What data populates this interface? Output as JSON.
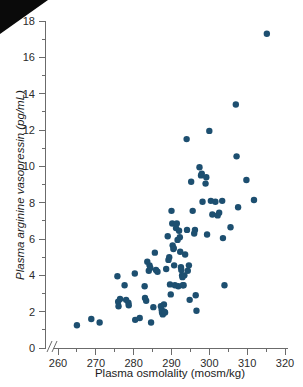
{
  "figure": {
    "background_color": "#ffffff",
    "point_color": "#1d4f70",
    "axis_color": "#6b6b6b",
    "corner_artifact": "black-triangle-top-left"
  },
  "chart_data": {
    "type": "scatter",
    "title": "",
    "xlabel": "Plasma osmolality (mosm/kg)",
    "ylabel": "Plasma arginine vasopressin (pg/mL)",
    "xlim": [
      258,
      320
    ],
    "ylim": [
      0,
      18
    ],
    "xticks": [
      260,
      270,
      280,
      290,
      300,
      310,
      320
    ],
    "yticks": [
      0,
      2,
      4,
      6,
      8,
      10,
      12,
      14,
      16,
      18
    ],
    "y_minor_ticks": [
      1,
      3,
      5,
      7,
      9,
      11,
      13,
      15,
      17
    ],
    "x_minor_ticks": [
      265,
      275,
      285,
      295,
      305,
      315
    ],
    "axis_break": true,
    "grid": false,
    "legend": null,
    "marker": "filled-circle",
    "marker_size_px": 4.2,
    "series": [
      {
        "name": "Subjects",
        "points": [
          [
            265.0,
            1.25
          ],
          [
            268.8,
            1.6
          ],
          [
            271.0,
            1.4
          ],
          [
            275.7,
            3.95
          ],
          [
            275.9,
            2.55
          ],
          [
            276.0,
            2.3
          ],
          [
            276.4,
            2.7
          ],
          [
            277.6,
            3.45
          ],
          [
            278.0,
            2.65
          ],
          [
            278.6,
            2.5
          ],
          [
            278.7,
            2.35
          ],
          [
            280.3,
            4.1
          ],
          [
            280.4,
            1.55
          ],
          [
            281.6,
            1.65
          ],
          [
            282.9,
            3.4
          ],
          [
            283.0,
            2.75
          ],
          [
            283.3,
            2.6
          ],
          [
            283.6,
            4.75
          ],
          [
            284.0,
            4.25
          ],
          [
            284.2,
            4.55
          ],
          [
            284.4,
            4.4
          ],
          [
            284.6,
            1.4
          ],
          [
            285.2,
            2.25
          ],
          [
            285.6,
            5.25
          ],
          [
            285.9,
            4.3
          ],
          [
            286.3,
            4.2
          ],
          [
            287.2,
            2.3
          ],
          [
            287.4,
            2.1
          ],
          [
            287.5,
            1.95
          ],
          [
            287.6,
            2.0
          ],
          [
            287.7,
            1.85
          ],
          [
            288.0,
            2.4
          ],
          [
            288.1,
            2.0
          ],
          [
            288.3,
            1.95
          ],
          [
            288.6,
            4.35
          ],
          [
            289.0,
            6.15
          ],
          [
            289.2,
            4.85
          ],
          [
            289.4,
            5.0
          ],
          [
            289.6,
            3.5
          ],
          [
            289.8,
            2.95
          ],
          [
            290.0,
            7.55
          ],
          [
            290.2,
            6.85
          ],
          [
            290.3,
            5.65
          ],
          [
            290.5,
            5.45
          ],
          [
            290.6,
            5.5
          ],
          [
            290.7,
            4.55
          ],
          [
            290.9,
            3.45
          ],
          [
            291.2,
            6.6
          ],
          [
            291.4,
            6.85
          ],
          [
            291.6,
            5.95
          ],
          [
            291.8,
            3.4
          ],
          [
            292.0,
            6.45
          ],
          [
            292.2,
            6.1
          ],
          [
            292.3,
            5.3
          ],
          [
            292.5,
            4.45
          ],
          [
            292.6,
            4.3
          ],
          [
            292.8,
            4.0
          ],
          [
            292.9,
            3.9
          ],
          [
            293.0,
            3.45
          ],
          [
            293.2,
            3.45
          ],
          [
            293.4,
            4.0
          ],
          [
            293.6,
            5.15
          ],
          [
            294.0,
            11.5
          ],
          [
            294.1,
            6.5
          ],
          [
            294.3,
            4.25
          ],
          [
            294.6,
            4.55
          ],
          [
            294.8,
            2.65
          ],
          [
            295.2,
            9.15
          ],
          [
            295.6,
            7.55
          ],
          [
            296.0,
            6.3
          ],
          [
            296.2,
            6.5
          ],
          [
            296.4,
            2.9
          ],
          [
            296.6,
            2.05
          ],
          [
            297.4,
            9.95
          ],
          [
            297.8,
            9.5
          ],
          [
            298.0,
            9.6
          ],
          [
            298.2,
            8.05
          ],
          [
            299.0,
            9.05
          ],
          [
            299.2,
            9.4
          ],
          [
            299.4,
            6.25
          ],
          [
            300.0,
            11.95
          ],
          [
            300.4,
            8.1
          ],
          [
            300.8,
            7.35
          ],
          [
            301.6,
            8.05
          ],
          [
            302.2,
            7.3
          ],
          [
            302.6,
            7.45
          ],
          [
            303.4,
            8.1
          ],
          [
            303.6,
            6.05
          ],
          [
            304.0,
            3.45
          ],
          [
            305.6,
            6.65
          ],
          [
            307.0,
            13.4
          ],
          [
            307.2,
            10.55
          ],
          [
            307.6,
            7.75
          ],
          [
            309.8,
            9.25
          ],
          [
            311.8,
            8.15
          ],
          [
            315.2,
            17.3
          ]
        ]
      }
    ]
  }
}
